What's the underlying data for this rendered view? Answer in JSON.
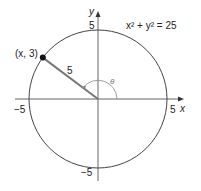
{
  "diagram": {
    "equation": "x² + y² = 25",
    "point_label": "(x, 3)",
    "radius_label": "5",
    "angle_label": "θ",
    "axis_x_label": "x",
    "axis_y_label": "y",
    "ticks": {
      "x_pos": "5",
      "x_neg": "−5",
      "y_pos": "5",
      "y_neg": "−5"
    },
    "colors": {
      "axis": "#555555",
      "circle": "#444444",
      "segment": "#777777",
      "point": "#111111"
    }
  }
}
